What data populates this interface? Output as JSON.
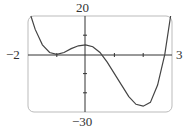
{
  "chart_data": {
    "type": "line",
    "title": "",
    "xlabel": "",
    "ylabel": "",
    "xlim": [
      -2,
      3
    ],
    "ylim": [
      -30,
      20
    ],
    "grid": false,
    "tick_labels": {
      "x_min": "−2",
      "x_max": "3",
      "y_max": "20",
      "y_min": "−30"
    },
    "x_ticks": [
      -1,
      1,
      2
    ],
    "y_ticks": [
      10,
      -10,
      -20
    ],
    "series": [
      {
        "name": "f(x)",
        "x": [
          -1.9,
          -1.75,
          -1.5,
          -1.25,
          -1.0,
          -0.75,
          -0.5,
          -0.25,
          0.0,
          0.25,
          0.5,
          0.75,
          1.0,
          1.25,
          1.5,
          1.75,
          2.0,
          2.25,
          2.5,
          2.75,
          2.95
        ],
        "values": [
          20,
          13,
          5,
          1,
          0,
          1,
          3,
          4.5,
          5,
          4,
          1,
          -4,
          -10,
          -16,
          -22,
          -26,
          -27,
          -25,
          -16,
          0,
          20
        ]
      }
    ]
  }
}
